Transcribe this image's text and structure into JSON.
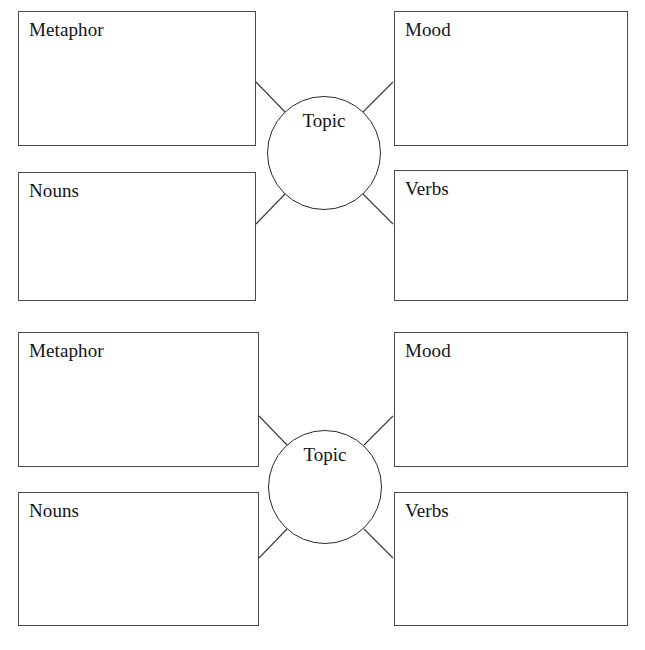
{
  "document": {
    "type": "graphic-organizer-worksheet",
    "organizer_count": 2,
    "page_background": "#ffffff",
    "ink_color": "#2a2a2a"
  },
  "organizers": [
    {
      "center": {
        "label": "Topic",
        "shape": "circle"
      },
      "boxes": [
        {
          "label": "Metaphor",
          "position": "top-left"
        },
        {
          "label": "Nouns",
          "position": "bottom-left"
        },
        {
          "label": "Mood",
          "position": "top-right"
        },
        {
          "label": "Verbs",
          "position": "bottom-right"
        }
      ]
    },
    {
      "center": {
        "label": "Topic",
        "shape": "circle"
      },
      "boxes": [
        {
          "label": "Metaphor",
          "position": "top-left"
        },
        {
          "label": "Nouns",
          "position": "bottom-left"
        },
        {
          "label": "Mood",
          "position": "top-right"
        },
        {
          "label": "Verbs",
          "position": "bottom-right"
        }
      ]
    }
  ]
}
